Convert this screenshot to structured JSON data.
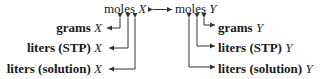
{
  "diagram": {
    "center_left": {
      "label": "moles",
      "var": "X"
    },
    "center_right": {
      "label": "moles",
      "var": "Y"
    },
    "left_items": [
      {
        "label": "grams",
        "var": "X"
      },
      {
        "label": "liters (STP)",
        "var": "X"
      },
      {
        "label": "liters (solution)",
        "var": "X"
      }
    ],
    "right_items": [
      {
        "label": "grams",
        "var": "Y"
      },
      {
        "label": "liters (STP)",
        "var": "Y"
      },
      {
        "label": "liters (solution)",
        "var": "Y"
      }
    ],
    "colors": {
      "text": "#1a1a1a",
      "line": "#333333",
      "background": "#ffffff"
    }
  }
}
